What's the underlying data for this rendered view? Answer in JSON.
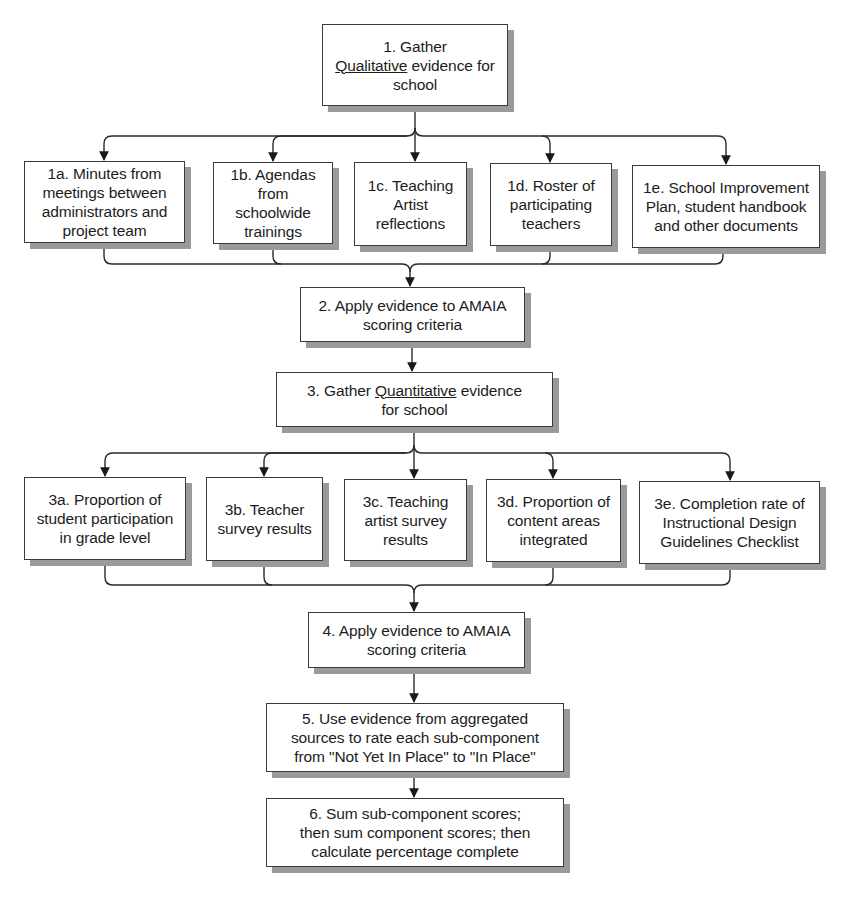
{
  "diagram": {
    "type": "flowchart",
    "colors": {
      "background": "#ffffff",
      "box_border": "#3a3a3a",
      "box_shadow": "#9a9a9a",
      "text": "#1c1c1c",
      "line": "#2a2a2a"
    },
    "step1": {
      "prefix": "1. Gather",
      "underlined": "Qualitative",
      "suffix": " evidence for school"
    },
    "qualitative_sources": [
      {
        "id": "1a",
        "label": "1a. Minutes from meetings between administrators and project team"
      },
      {
        "id": "1b",
        "label": "1b. Agendas from schoolwide trainings"
      },
      {
        "id": "1c",
        "label": "1c. Teaching Artist reflections"
      },
      {
        "id": "1d",
        "label": "1d. Roster of participating teachers"
      },
      {
        "id": "1e",
        "label": "1e. School Improvement Plan, student handbook and other documents"
      }
    ],
    "step2": {
      "label": "2. Apply evidence to AMAIA scoring criteria"
    },
    "step3": {
      "prefix": "3. Gather ",
      "underlined": "Quantitative",
      "suffix": " evidence for school"
    },
    "quantitative_sources": [
      {
        "id": "3a",
        "label": "3a. Proportion of student participation in grade level"
      },
      {
        "id": "3b",
        "label": "3b. Teacher survey results"
      },
      {
        "id": "3c",
        "label": "3c. Teaching artist survey results"
      },
      {
        "id": "3d",
        "label": "3d. Proportion of content areas integrated"
      },
      {
        "id": "3e",
        "label": "3e. Completion rate of Instructional Design Guidelines Checklist"
      }
    ],
    "step4": {
      "label": "4. Apply evidence to AMAIA scoring criteria"
    },
    "step5": {
      "label": "5. Use evidence from aggregated sources to rate each sub-component from \"Not Yet In Place\" to \"In Place\""
    },
    "step6": {
      "label": "6. Sum sub-component scores; then sum component scores; then calculate percentage complete"
    }
  }
}
